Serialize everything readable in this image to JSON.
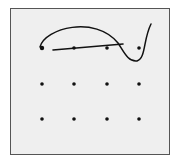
{
  "diagram": {
    "type": "nine-dot-style puzzle sketch",
    "grid": {
      "rows": 3,
      "cols": 4,
      "x": [
        42,
        74,
        107,
        139
      ],
      "y": [
        48,
        84,
        119
      ]
    },
    "colors": {
      "background": "#efefef",
      "border": "#555555",
      "ink": "#111111"
    }
  }
}
